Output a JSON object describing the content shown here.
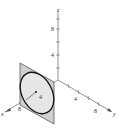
{
  "diagram": {
    "type": "3d-axes-with-disk",
    "axes": {
      "x": {
        "label": "x",
        "ticks": [
          "8"
        ]
      },
      "y": {
        "label": "y",
        "ticks": [
          "4",
          "8"
        ]
      },
      "z": {
        "label": "z",
        "ticks": [
          "4",
          "8"
        ]
      }
    },
    "disk": {
      "radius_label": "4",
      "fill": "#e6e6e6",
      "plane_fill": "#cfcfcf",
      "edge": "#111111"
    }
  }
}
